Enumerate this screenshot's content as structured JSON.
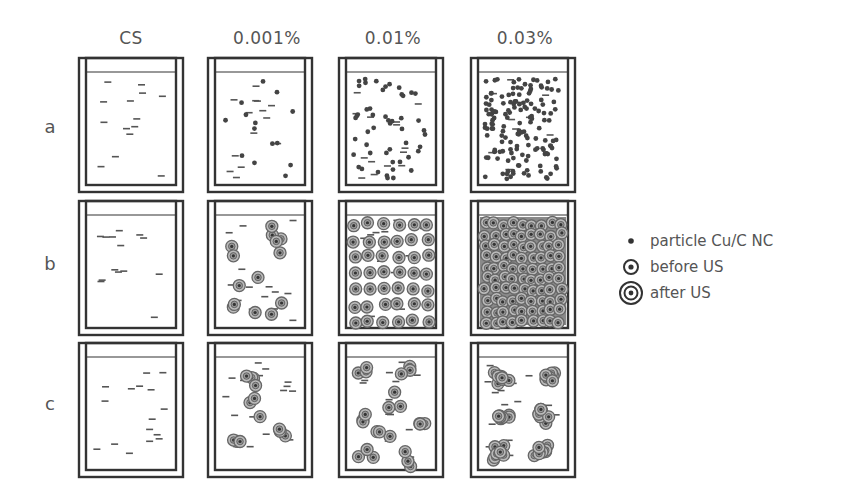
{
  "figure": {
    "columns": [
      {
        "label": "CS",
        "x": 78
      },
      {
        "label": "0.001%",
        "x": 207
      },
      {
        "label": "0.01%",
        "x": 338
      },
      {
        "label": "0.03%",
        "x": 470
      }
    ],
    "rows": [
      {
        "label": "a",
        "y": 57,
        "description": "particle dispersion"
      },
      {
        "label": "b",
        "y": 200,
        "description": "before US"
      },
      {
        "label": "c",
        "y": 342,
        "description": "after US"
      }
    ],
    "container": {
      "width": 106,
      "height": 136
    },
    "colors": {
      "outline": "#333333",
      "dash": "#555555",
      "particle": "#444444",
      "ring": "#666666",
      "text": "#555555"
    }
  },
  "legend": {
    "items": [
      {
        "label": "particle Cu/C NC",
        "icon": "dot-icon"
      },
      {
        "label": "before US",
        "icon": "single-ring-icon"
      },
      {
        "label": "after US",
        "icon": "double-ring-icon"
      }
    ]
  }
}
